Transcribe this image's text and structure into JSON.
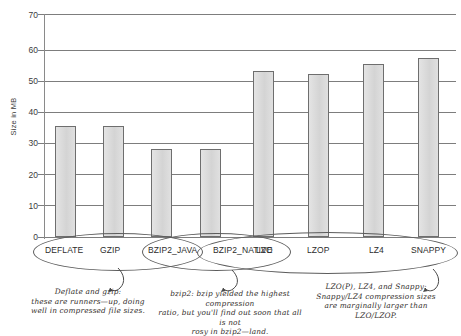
{
  "chart_data": {
    "type": "bar",
    "title": "",
    "xlabel": "",
    "ylabel": "Size in MB",
    "ylim": [
      0,
      73
    ],
    "yticks": [
      0,
      10,
      20,
      30,
      40,
      50,
      60,
      70
    ],
    "grid": true,
    "legend": "none",
    "categories": [
      "DEFLATE",
      "GZIP",
      "BZIP2_JAVA",
      "BZIP2_NATIVE",
      "LZO",
      "LZOP",
      "LZ4",
      "SNAPPY"
    ],
    "values": [
      36.5,
      36.5,
      28.8,
      28.8,
      54.5,
      53.5,
      56.5,
      58.5
    ],
    "bar_fill": "#dcdcdc",
    "bar_stroke": "#6e6e6e",
    "groups": [
      {
        "name": "deflate-gzip-group",
        "members": [
          "DEFLATE",
          "GZIP"
        ]
      },
      {
        "name": "bzip2-group",
        "members": [
          "BZIP2_JAVA",
          "BZIP2_NATIVE"
        ]
      },
      {
        "name": "lzo-lzop-lz4-snappy-group",
        "members": [
          "LZO",
          "LZOP",
          "LZ4",
          "SNAPPY"
        ]
      }
    ],
    "annotations": [
      {
        "id": "note-deflate-gzip",
        "text": "Deflate and gzip:\nthese are runners—up, doing\nwell in compressed file sizes.",
        "points_to": "deflate-gzip-group"
      },
      {
        "id": "note-bzip2",
        "text": "bzip2: bzip yielded the highest compression\nratio, but you'll find out soon that all is not\nrosy in bzip2—land.",
        "points_to": "bzip2-group"
      },
      {
        "id": "note-lzo-lz4-snappy",
        "text": "LZO(P), LZ4, and Snappy:\nSnappy/LZ4 compression sizes\nare marginally larger than\nLZO/LZOP.",
        "points_to": "lzo-lzop-lz4-snappy-group"
      }
    ]
  },
  "axis": {
    "ytick_labels": [
      "70",
      "60",
      "50",
      "40",
      "30",
      "20",
      "10",
      "0"
    ],
    "y_title": "Size in MB"
  },
  "categories": {
    "deflate": "DEFLATE",
    "gzip": "GZIP",
    "bzip2_java": "BZIP2_JAVA",
    "bzip2_native": "BZIP2_NATIVE",
    "lzo": "LZO",
    "lzop": "LZOP",
    "lz4": "LZ4",
    "snappy": "SNAPPY"
  },
  "notes": {
    "deflate_gzip": "Deflate and gzip:\nthese are runners—up, doing\nwell in compressed file sizes.",
    "bzip2": "bzip2: bzip yielded the highest compression\nratio, but you'll find out soon that all is not\nrosy in bzip2—land.",
    "lzo_family": "LZO(P), LZ4, and Snappy:\nSnappy/LZ4 compression sizes\nare marginally larger than\nLZO/LZOP."
  }
}
